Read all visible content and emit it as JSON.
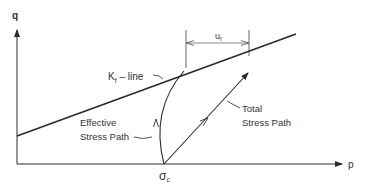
{
  "diagram": {
    "axes": {
      "y_label": "q",
      "x_label": "p"
    },
    "kf_line": {
      "label_main": "K",
      "label_sub": "f",
      "label_suffix": " – line"
    },
    "dimension": {
      "label_main": "u",
      "label_sub": "f"
    },
    "effective_path": {
      "line1": "Effective",
      "line2": "Stress Path"
    },
    "total_path": {
      "line1": "Total",
      "line2": "Stress Path"
    },
    "origin_point": {
      "label_main": "σ",
      "label_sub": "c"
    },
    "colors": {
      "line": "#2a2a2a",
      "text": "#333333",
      "background": "#ffffff"
    }
  }
}
